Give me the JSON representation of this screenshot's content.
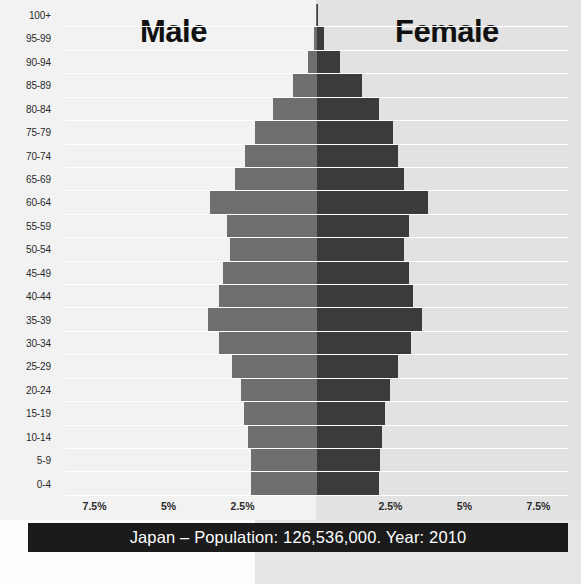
{
  "titles": {
    "male": "Male",
    "female": "Female"
  },
  "caption": "Japan – Population: 126,536,000. Year: 2010",
  "colors": {
    "male_bar": "#6f6f6f",
    "female_bar": "#3b3b3b",
    "background_left": "#f2f2f2",
    "background_right": "#e2e2e2",
    "caption_background": "#1b1b1b",
    "caption_text": "#ffffff",
    "gridline": "#ffffff"
  },
  "chart_data": {
    "type": "bar",
    "subtype": "population-pyramid",
    "title": "Japan – Population: 126,536,000. Year: 2010",
    "country": "Japan",
    "population": "126,536,000",
    "year": "2010",
    "xlabel": "",
    "ylabel": "",
    "orientation": "horizontal-diverging",
    "grid": true,
    "legend_position": "top-inline",
    "xlim": [
      -8.5,
      8.5
    ],
    "xticks": [
      7.5,
      5,
      2.5,
      2.5,
      5,
      7.5
    ],
    "xtick_labels": [
      "7.5%",
      "5%",
      "2.5%",
      "2.5%",
      "5%",
      "7.5%"
    ],
    "xtick_positions_pct": [
      7.5,
      5,
      2.5,
      -2.5,
      -5,
      -7.5
    ],
    "value_unit": "percent of total population",
    "categories": [
      "0-4",
      "5-9",
      "10-14",
      "15-19",
      "20-24",
      "25-29",
      "30-34",
      "35-39",
      "40-44",
      "45-49",
      "50-54",
      "55-59",
      "60-64",
      "65-69",
      "70-74",
      "75-79",
      "80-84",
      "85-89",
      "90-94",
      "95-99",
      "100+"
    ],
    "series": [
      {
        "name": "Male",
        "color": "#6f6f6f",
        "side": "left",
        "values": [
          2.22,
          2.23,
          2.33,
          2.44,
          2.56,
          2.85,
          3.3,
          3.66,
          3.3,
          3.15,
          2.92,
          3.03,
          3.6,
          2.76,
          2.42,
          2.09,
          1.47,
          0.79,
          0.3,
          0.07,
          0.01
        ]
      },
      {
        "name": "Female",
        "color": "#3b3b3b",
        "side": "right",
        "values": [
          2.11,
          2.13,
          2.22,
          2.33,
          2.47,
          2.77,
          3.21,
          3.57,
          3.26,
          3.14,
          2.95,
          3.11,
          3.78,
          2.97,
          2.74,
          2.58,
          2.12,
          1.55,
          0.78,
          0.25,
          0.04
        ]
      }
    ]
  }
}
